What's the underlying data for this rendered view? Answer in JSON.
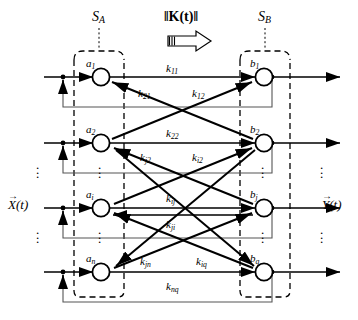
{
  "diagram": {
    "title_left_set": "S",
    "title_left_sub": "A",
    "title_right_set": "S",
    "title_right_sub": "B",
    "kernel_label": "‖K(t)‖",
    "arrow_icon": "block-arrow-right",
    "input_vector": "X(t)",
    "output_vector": "Y(t)",
    "vertical_ellipsis": "⋮",
    "left_nodes": [
      {
        "name": "a",
        "sub": "1"
      },
      {
        "name": "a",
        "sub": "2"
      },
      {
        "name": "a",
        "sub": "i"
      },
      {
        "name": "a",
        "sub": "n"
      }
    ],
    "right_nodes": [
      {
        "name": "b",
        "sub": "1"
      },
      {
        "name": "b",
        "sub": "2"
      },
      {
        "name": "b",
        "sub": "j"
      },
      {
        "name": "b",
        "sub": "q"
      }
    ],
    "edge_labels": [
      {
        "name": "k",
        "sub": "11"
      },
      {
        "name": "k",
        "sub": "21"
      },
      {
        "name": "k",
        "sub": "12"
      },
      {
        "name": "k",
        "sub": "22"
      },
      {
        "name": "k",
        "sub": "j2"
      },
      {
        "name": "k",
        "sub": "i2"
      },
      {
        "name": "k",
        "sub": "ij"
      },
      {
        "name": "k",
        "sub": "ji"
      },
      {
        "name": "k",
        "sub": "jn"
      },
      {
        "name": "k",
        "sub": "iq"
      },
      {
        "name": "k",
        "sub": "nq"
      }
    ],
    "colors": {
      "stroke": "#000000",
      "background": "#ffffff",
      "feedback_line": "#555555",
      "arrow_fill": "#ffffff"
    }
  }
}
